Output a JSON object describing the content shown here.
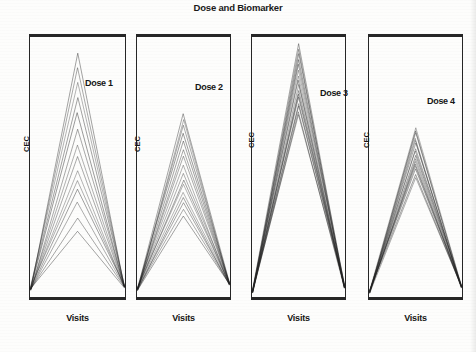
{
  "figure": {
    "title": "Dose and Biomarker",
    "xlabel": "Visits",
    "ylabel": "CEC"
  },
  "panels": [
    {
      "dose_label": "Dose 1",
      "xlabel": "Visits",
      "ylabel": "CEC"
    },
    {
      "dose_label": "Dose 2",
      "xlabel": "Visits",
      "ylabel": "CEC"
    },
    {
      "dose_label": "Dose 3",
      "xlabel": "Visits",
      "ylabel": "CEC"
    },
    {
      "dose_label": "Dose 4",
      "xlabel": "Visits",
      "ylabel": "CEC"
    }
  ],
  "chart_data": {
    "type": "line",
    "title": "Dose and Biomarker",
    "xlabel": "Visits",
    "ylabel": "CEC",
    "grid": false,
    "legend": false,
    "x": [
      1,
      2,
      3
    ],
    "xtick_labels": [
      "",
      "",
      ""
    ],
    "ytick_labels": [],
    "ylim": [
      0,
      100
    ],
    "panels": [
      {
        "name": "Dose 1",
        "n_subjects": 14,
        "peak_range": [
          26,
          96
        ],
        "series": [
          {
            "name": "subject-1",
            "values": [
              3,
              96,
              4
            ]
          },
          {
            "name": "subject-2",
            "values": [
              3,
              90,
              4
            ]
          },
          {
            "name": "subject-3",
            "values": [
              3,
              84,
              4
            ]
          },
          {
            "name": "subject-4",
            "values": [
              3,
              78,
              4
            ]
          },
          {
            "name": "subject-5",
            "values": [
              3,
              72,
              4
            ]
          },
          {
            "name": "subject-6",
            "values": [
              3,
              66,
              4
            ]
          },
          {
            "name": "subject-7",
            "values": [
              3,
              60,
              4
            ]
          },
          {
            "name": "subject-8",
            "values": [
              3,
              55,
              4
            ]
          },
          {
            "name": "subject-9",
            "values": [
              3,
              50,
              4
            ]
          },
          {
            "name": "subject-10",
            "values": [
              3,
              46,
              4
            ]
          },
          {
            "name": "subject-11",
            "values": [
              3,
              42,
              4
            ]
          },
          {
            "name": "subject-12",
            "values": [
              3,
              37,
              4
            ]
          },
          {
            "name": "subject-13",
            "values": [
              3,
              31,
              4
            ]
          },
          {
            "name": "subject-14",
            "values": [
              3,
              26,
              4
            ]
          }
        ]
      },
      {
        "name": "Dose 2",
        "n_subjects": 16,
        "peak_range": [
          32,
          72
        ],
        "series": [
          {
            "name": "subject-1",
            "values": [
              3,
              72,
              5
            ]
          },
          {
            "name": "subject-2",
            "values": [
              3,
              70,
              5
            ]
          },
          {
            "name": "subject-3",
            "values": [
              3,
              67,
              5
            ]
          },
          {
            "name": "subject-4",
            "values": [
              3,
              64,
              5
            ]
          },
          {
            "name": "subject-5",
            "values": [
              3,
              61,
              5
            ]
          },
          {
            "name": "subject-6",
            "values": [
              3,
              58,
              5
            ]
          },
          {
            "name": "subject-7",
            "values": [
              3,
              55,
              5
            ]
          },
          {
            "name": "subject-8",
            "values": [
              3,
              52,
              5
            ]
          },
          {
            "name": "subject-9",
            "values": [
              3,
              49,
              5
            ]
          },
          {
            "name": "subject-10",
            "values": [
              3,
              46,
              5
            ]
          },
          {
            "name": "subject-11",
            "values": [
              3,
              44,
              5
            ]
          },
          {
            "name": "subject-12",
            "values": [
              3,
              41,
              5
            ]
          },
          {
            "name": "subject-13",
            "values": [
              3,
              39,
              5
            ]
          },
          {
            "name": "subject-14",
            "values": [
              3,
              37,
              5
            ]
          },
          {
            "name": "subject-15",
            "values": [
              3,
              34,
              5
            ]
          },
          {
            "name": "subject-16",
            "values": [
              3,
              32,
              5
            ]
          }
        ]
      },
      {
        "name": "Dose 3",
        "n_subjects": 16,
        "peak_range": [
          72,
          99
        ],
        "series": [
          {
            "name": "subject-1",
            "values": [
              2,
              99,
              4
            ]
          },
          {
            "name": "subject-2",
            "values": [
              2,
              97,
              4
            ]
          },
          {
            "name": "subject-3",
            "values": [
              2,
              95,
              4
            ]
          },
          {
            "name": "subject-4",
            "values": [
              2,
              93,
              4
            ]
          },
          {
            "name": "subject-5",
            "values": [
              2,
              91,
              4
            ]
          },
          {
            "name": "subject-6",
            "values": [
              2,
              89,
              4
            ]
          },
          {
            "name": "subject-7",
            "values": [
              2,
              87,
              4
            ]
          },
          {
            "name": "subject-8",
            "values": [
              2,
              85,
              4
            ]
          },
          {
            "name": "subject-9",
            "values": [
              2,
              83,
              4
            ]
          },
          {
            "name": "subject-10",
            "values": [
              2,
              81,
              4
            ]
          },
          {
            "name": "subject-11",
            "values": [
              2,
              80,
              4
            ]
          },
          {
            "name": "subject-12",
            "values": [
              2,
              78,
              4
            ]
          },
          {
            "name": "subject-13",
            "values": [
              2,
              76,
              4
            ]
          },
          {
            "name": "subject-14",
            "values": [
              2,
              75,
              4
            ]
          },
          {
            "name": "subject-15",
            "values": [
              2,
              73,
              4
            ]
          },
          {
            "name": "subject-16",
            "values": [
              2,
              72,
              4
            ]
          }
        ]
      },
      {
        "name": "Dose 4",
        "n_subjects": 16,
        "peak_range": [
          47,
          66
        ],
        "series": [
          {
            "name": "subject-1",
            "values": [
              2,
              66,
              4
            ]
          },
          {
            "name": "subject-2",
            "values": [
              2,
              65,
              4
            ]
          },
          {
            "name": "subject-3",
            "values": [
              2,
              64,
              4
            ]
          },
          {
            "name": "subject-4",
            "values": [
              2,
              62,
              4
            ]
          },
          {
            "name": "subject-5",
            "values": [
              2,
              61,
              4
            ]
          },
          {
            "name": "subject-6",
            "values": [
              2,
              60,
              4
            ]
          },
          {
            "name": "subject-7",
            "values": [
              2,
              58,
              4
            ]
          },
          {
            "name": "subject-8",
            "values": [
              2,
              57,
              4
            ]
          },
          {
            "name": "subject-9",
            "values": [
              2,
              56,
              4
            ]
          },
          {
            "name": "subject-10",
            "values": [
              2,
              54,
              4
            ]
          },
          {
            "name": "subject-11",
            "values": [
              2,
              53,
              4
            ]
          },
          {
            "name": "subject-12",
            "values": [
              2,
              52,
              4
            ]
          },
          {
            "name": "subject-13",
            "values": [
              2,
              51,
              4
            ]
          },
          {
            "name": "subject-14",
            "values": [
              2,
              50,
              4
            ]
          },
          {
            "name": "subject-15",
            "values": [
              2,
              48,
              4
            ]
          },
          {
            "name": "subject-16",
            "values": [
              2,
              47,
              4
            ]
          }
        ]
      }
    ]
  }
}
